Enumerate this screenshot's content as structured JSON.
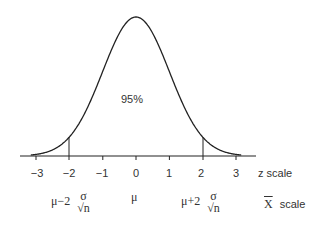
{
  "chart_data": {
    "type": "line",
    "title": "",
    "x": [
      -3.2,
      -3,
      -2.5,
      -2,
      -1.5,
      -1,
      -0.5,
      0,
      0.5,
      1,
      1.5,
      2,
      2.5,
      3,
      3.2
    ],
    "series": [
      {
        "name": "normal density",
        "values": [
          0.0024,
          0.0044,
          0.0175,
          0.054,
          0.1295,
          0.242,
          0.3521,
          0.3989,
          0.3521,
          0.242,
          0.1295,
          0.054,
          0.0175,
          0.0044,
          0.0024
        ]
      }
    ],
    "annotations": [
      {
        "text": "95%",
        "x": 0,
        "y": 0.2
      },
      {
        "type": "vline",
        "x": -2
      },
      {
        "type": "vline",
        "x": 2
      }
    ],
    "xlabel": "z scale",
    "xticks": [
      -3,
      -2,
      -1,
      0,
      1,
      2,
      3
    ],
    "grid": false
  },
  "labels": {
    "area": "95%",
    "z_ticks": [
      "−3",
      "−2",
      "−1",
      "0",
      "1",
      "2",
      "3"
    ],
    "z_scale": "z scale",
    "xbar_scale_symbol": "X",
    "xbar_scale_word": "scale",
    "mu": "μ",
    "left_prefix": "μ−2",
    "right_prefix": "μ+2",
    "sigma": "σ",
    "n": "n",
    "sqrt": "√"
  }
}
